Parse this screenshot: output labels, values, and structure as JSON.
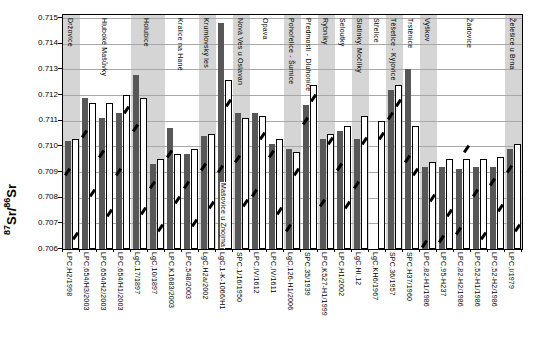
{
  "chart_data": {
    "type": "bar",
    "title": "",
    "ylabel": "87Sr/86Sr",
    "ylabel_parts": {
      "sup_left": "87",
      "mid": "Sr/",
      "sup_right": "86",
      "end": "Sr"
    },
    "xlabel": "",
    "ylim": [
      0.706,
      0.71512
    ],
    "ytick_labels": [
      "0.715",
      "0.714",
      "0.713",
      "0.712",
      "0.711",
      "0.710",
      "0.709",
      "0.708",
      "0.707",
      "0.706"
    ],
    "ytick_values": [
      0.715,
      0.714,
      0.713,
      0.712,
      0.711,
      0.71,
      0.709,
      0.708,
      0.707,
      0.706
    ],
    "grid": "horizontal",
    "legend": "none",
    "series_styles": [
      {
        "name": "dark-gray-bar",
        "color": "#575757"
      },
      {
        "name": "white-bar",
        "color": "#ffffff"
      }
    ],
    "band_color": "#d5d5d5",
    "mark_color": "#000000",
    "groups": [
      {
        "site": "Držovice",
        "count": 1,
        "shaded": true,
        "label_position": "top"
      },
      {
        "site": "Hluboké Mašůvky",
        "count": 3,
        "shaded": false,
        "label_position": "top"
      },
      {
        "site": "Holubice",
        "count": 2,
        "shaded": true,
        "label_position": "top"
      },
      {
        "site": "Kralice na Hané",
        "count": 2,
        "shaded": false,
        "label_position": "top"
      },
      {
        "site": "Krumlovský les",
        "count": 1,
        "shaded": true,
        "label_position": "top"
      },
      {
        "site": "Mašovice u Znojma",
        "count": 1,
        "shaded": false,
        "label_position": "bottom"
      },
      {
        "site": "Nová Ves u Oslavan",
        "count": 1,
        "shaded": true,
        "label_position": "top"
      },
      {
        "site": "Opava",
        "count": 2,
        "shaded": false,
        "label_position": "top"
      },
      {
        "site": "Pohořelice - Šumice",
        "count": 1,
        "shaded": true,
        "label_position": "top"
      },
      {
        "site": "Předmostí - Dluhonice",
        "count": 1,
        "shaded": false,
        "label_position": "top"
      },
      {
        "site": "Rybníky",
        "count": 1,
        "shaded": true,
        "label_position": "top"
      },
      {
        "site": "Seloutky",
        "count": 1,
        "shaded": false,
        "label_position": "top"
      },
      {
        "site": "Slatinky, Močílky",
        "count": 1,
        "shaded": true,
        "label_position": "top"
      },
      {
        "site": "Střelice",
        "count": 1,
        "shaded": false,
        "label_position": "top"
      },
      {
        "site": "Těšetice - Kyjovice",
        "count": 1,
        "shaded": true,
        "label_position": "top"
      },
      {
        "site": "Trstěnice",
        "count": 1,
        "shaded": false,
        "label_position": "top"
      },
      {
        "site": "Vyškov",
        "count": 1,
        "shaded": true,
        "label_position": "top"
      },
      {
        "site": "Žádovice",
        "count": 4,
        "shaded": false,
        "label_position": "top"
      },
      {
        "site": "Želešice u Brna",
        "count": 1,
        "shaded": true,
        "label_position": "top"
      }
    ],
    "samples": [
      {
        "code": "LPC,H2/1998",
        "dark": 0.7102,
        "white": 0.7103,
        "dark_mark": 0.709,
        "white_mark": 0.7065
      },
      {
        "code": "LPC,654/H3/2003",
        "dark": 0.7119,
        "white": 0.7117,
        "dark_mark": 0.7105,
        "white_mark": 0.7082
      },
      {
        "code": "LPC,654/H2/2003",
        "dark": 0.7111,
        "white": 0.7117,
        "dark_mark": 0.7097,
        "white_mark": 0.7074
      },
      {
        "code": "LPC,654/H1/2003",
        "dark": 0.7113,
        "white": 0.712,
        "dark_mark": 0.709,
        "white_mark": 0.7114
      },
      {
        "code": "LgC,17/1897",
        "dark": 0.7128,
        "white": 0.7119,
        "dark_mark": 0.7107,
        "white_mark": 0.7075
      },
      {
        "code": "LgC,10/1897",
        "dark": 0.7093,
        "white": 0.7095,
        "dark_mark": 0.7085,
        "white_mark": 0.7068
      },
      {
        "code": "LPC,K1683/2003",
        "dark": 0.7107,
        "white": 0.7097,
        "dark_mark": 0.7097,
        "white_mark": 0.7079
      },
      {
        "code": "LPC,548/2003",
        "dark": 0.7097,
        "white": 0.7099,
        "dark_mark": 0.7085,
        "white_mark": 0.707
      },
      {
        "code": "LgC,H2a/2002",
        "dark": 0.7104,
        "white": 0.7105,
        "dark_mark": 0.7092,
        "white_mark": 0.7077
      },
      {
        "code": "LgC,1-K-1066/H1",
        "dark": 0.7148,
        "white": 0.7126,
        "dark_mark": 0.7091,
        "white_mark": 0.7117
      },
      {
        "code": "SPC,1/16/1950",
        "dark": 0.7113,
        "white": 0.7111,
        "dark_mark": 0.7095,
        "white_mark": 0.7078
      },
      {
        "code": "LPC,IV/1612",
        "dark": 0.7113,
        "white": 0.7112,
        "dark_mark": 0.7082,
        "white_mark": 0.7104
      },
      {
        "code": "LPC,IV/1611",
        "dark": 0.7101,
        "white": 0.7103,
        "dark_mark": 0.7097,
        "white_mark": 0.7075
      },
      {
        "code": "LgC,126-H1/2006",
        "dark": 0.7099,
        "white": 0.7098,
        "dark_mark": 0.7068,
        "white_mark": 0.709
      },
      {
        "code": "SPC,35/1939",
        "dark": 0.7116,
        "white": 0.7124,
        "dark_mark": 0.711,
        "white_mark": 0.7119
      },
      {
        "code": "LPC,K527-H1/1999",
        "dark": 0.7103,
        "white": 0.7105,
        "dark_mark": 0.7078,
        "white_mark": 0.7102
      },
      {
        "code": "LPC,H1/2002",
        "dark": 0.7106,
        "white": 0.7108,
        "dark_mark": 0.7092,
        "white_mark": 0.7077
      },
      {
        "code": "LgC,HI,12",
        "dark": 0.7103,
        "white": 0.7112,
        "dark_mark": 0.7085,
        "white_mark": 0.7102
      },
      {
        "code": "LgC,KH6/1967",
        "dark": null,
        "white": 0.711,
        "dark_mark": null,
        "white_mark": 0.7104
      },
      {
        "code": "SPC,36/1957",
        "dark": 0.7122,
        "white": 0.7124,
        "dark_mark": 0.7112,
        "white_mark": 0.7117
      },
      {
        "code": "SPC,H37/1960",
        "dark": 0.713,
        "white": 0.7108,
        "dark_mark": 0.7095,
        "white_mark": 0.709
      },
      {
        "code": "LPC,82-H1/1986",
        "dark": 0.7092,
        "white": 0.7094,
        "dark_mark": 0.7062,
        "white_mark": 0.708
      },
      {
        "code": "LPC,95-H237",
        "dark": 0.7092,
        "white": 0.7095,
        "dark_mark": 0.7064,
        "white_mark": 0.7074
      },
      {
        "code": "LPC,82-H2/1986",
        "dark": 0.7091,
        "white": 0.7095,
        "dark_mark": 0.7067,
        "white_mark": 0.7099
      },
      {
        "code": "LPC,52-H1/1986",
        "dark": 0.7092,
        "white": 0.7095,
        "dark_mark": 0.7082,
        "white_mark": 0.7065
      },
      {
        "code": "LPC,52-H2/1986",
        "dark": 0.7092,
        "white": 0.7096,
        "dark_mark": 0.7086,
        "white_mark": 0.7076
      },
      {
        "code": "LPC,I/1979",
        "dark": 0.7099,
        "white": 0.7101,
        "dark_mark": 0.7091,
        "white_mark": 0.7068
      }
    ]
  }
}
